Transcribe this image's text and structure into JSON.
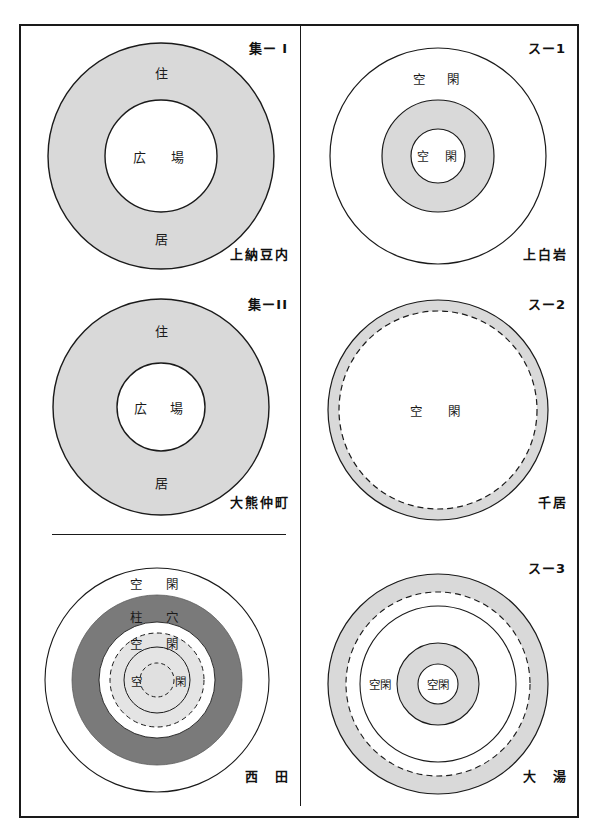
{
  "figure": {
    "title_visible": false,
    "border_color": "#1a1a1a",
    "fill_gray_light": "#d9d9d9",
    "fill_gray_pale": "#e4e4e4",
    "fill_gray_dark": "#7a7a7a",
    "fill_white": "#ffffff"
  },
  "panels": [
    {
      "id": "shu-1",
      "code": "集ー I",
      "site": "上納豆内",
      "labels": {
        "outer_top": "住",
        "outer_bottom": "居",
        "center": "広　場"
      },
      "rings": [
        {
          "name": "outer-settlement-ring",
          "fill": "#d9d9d9",
          "stroke": "solid",
          "radius": 113
        },
        {
          "name": "central-plaza",
          "fill": "#ffffff",
          "stroke": "solid",
          "radius": 56
        }
      ]
    },
    {
      "id": "su-1",
      "code": "スー1",
      "site": "上白岩",
      "labels": {
        "outer_top": "空　閑",
        "center": "空　閑"
      },
      "rings": [
        {
          "name": "outer-open-ring",
          "fill": "#ffffff",
          "stroke": "solid",
          "radius": 108
        },
        {
          "name": "stone-circle-band",
          "fill": "#d9d9d9",
          "stroke": "solid",
          "radius": 56
        },
        {
          "name": "inner-open-space",
          "fill": "#ffffff",
          "stroke": "solid",
          "radius": 27
        }
      ]
    },
    {
      "id": "shu-2",
      "code": "集ーII",
      "site": "大熊仲町",
      "labels": {
        "outer_top": "住",
        "outer_bottom": "居",
        "center": "広　場"
      },
      "rings": [
        {
          "name": "outer-settlement-ring",
          "fill": "#d9d9d9",
          "stroke": "solid",
          "radius": 108
        },
        {
          "name": "central-plaza",
          "fill": "#ffffff",
          "stroke": "solid",
          "radius": 44
        }
      ]
    },
    {
      "id": "su-2",
      "code": "スー2",
      "site": "千居",
      "labels": {
        "center": "空　閑"
      },
      "rings": [
        {
          "name": "stone-circle-band",
          "fill": "#d9d9d9",
          "stroke": "solid",
          "radius": 110
        },
        {
          "name": "inner-open-space",
          "fill": "#ffffff",
          "stroke": "dashed",
          "radius": 99
        }
      ]
    },
    {
      "id": "nishida",
      "code": "",
      "site": "西　田",
      "labels": {
        "ring_outer": "空　閑",
        "ring_posthole": "柱　穴",
        "ring_inner_open": "空　閑",
        "center_left": "空",
        "center_right": "閑"
      },
      "rings": [
        {
          "name": "outer-open-ring",
          "fill": "#ffffff",
          "stroke": "solid",
          "radius": 112
        },
        {
          "name": "posthole-band",
          "fill": "#7a7a7a",
          "stroke": "none",
          "radius": 85
        },
        {
          "name": "open-space-ring",
          "fill": "#ffffff",
          "stroke": "none",
          "radius": 58
        },
        {
          "name": "dashed-band",
          "fill": "#e4e4e4",
          "stroke": "dashed",
          "radius": 47
        },
        {
          "name": "solid-inner-circle",
          "fill": "#e4e4e4",
          "stroke": "solid",
          "radius": 33
        },
        {
          "name": "core-dashed-circle",
          "fill": "#e0e0e0",
          "stroke": "dashed",
          "radius": 17
        }
      ]
    },
    {
      "id": "su-3",
      "code": "スー3",
      "site": "大　湯",
      "labels": {
        "ring_open": "空閑",
        "center": "空閑"
      },
      "rings": [
        {
          "name": "outer-stone-band",
          "fill": "#d9d9d9",
          "stroke": "solid",
          "radius": 110
        },
        {
          "name": "outer-band-inner-edge",
          "fill": "#ffffff",
          "stroke": "dashed",
          "radius": 92
        },
        {
          "name": "open-space-ring",
          "fill": "#ffffff",
          "stroke": "solid",
          "radius": 78
        },
        {
          "name": "inner-stone-circle",
          "fill": "#d9d9d9",
          "stroke": "solid",
          "radius": 41
        },
        {
          "name": "core-open-space",
          "fill": "#ffffff",
          "stroke": "solid",
          "radius": 20
        }
      ]
    }
  ]
}
